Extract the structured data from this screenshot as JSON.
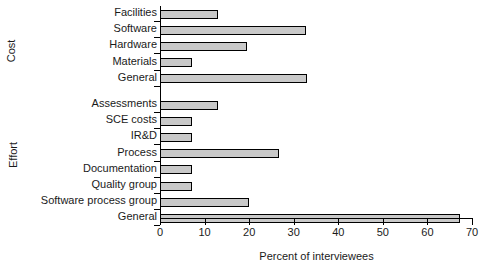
{
  "chart_data": {
    "type": "bar",
    "orientation": "horizontal",
    "title": "",
    "xlabel": "Percent of interviewees",
    "ylabel": "",
    "xlim": [
      0,
      70
    ],
    "xticks": [
      0,
      10,
      20,
      30,
      40,
      50,
      60,
      70
    ],
    "grid": false,
    "legend": null,
    "bar_fill_color": "#c9c9c9",
    "bar_edge_color": "#000000",
    "groups": [
      {
        "name": "Cost",
        "categories": [
          "Facilities",
          "Software",
          "Hardware",
          "Materials",
          "General"
        ],
        "values": [
          13,
          32.7,
          19.6,
          7.2,
          33
        ]
      },
      {
        "name": "Effort",
        "categories": [
          "Assessments",
          "SCE costs",
          "IR&D",
          "Process",
          "Documentation",
          "Quality group",
          "Software process group",
          "General"
        ],
        "values": [
          13,
          7.2,
          7.2,
          26.8,
          7.2,
          7.2,
          20,
          67.2
        ]
      }
    ],
    "categories": [
      "Facilities",
      "Software",
      "Hardware",
      "Materials",
      "General",
      "Assessments",
      "SCE costs",
      "IR&D",
      "Process",
      "Documentation",
      "Quality group",
      "Software process group",
      "General"
    ],
    "values": [
      13,
      32.7,
      19.6,
      7.2,
      33,
      13,
      7.2,
      7.2,
      26.8,
      7.2,
      7.2,
      20,
      67.2
    ]
  }
}
